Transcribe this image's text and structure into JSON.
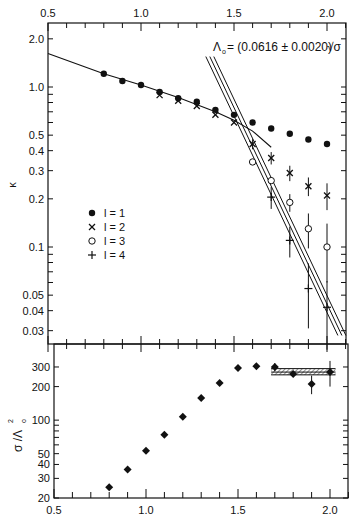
{
  "chart_data": [
    {
      "panel": "upper",
      "type": "scatter",
      "title": "",
      "annotation": "Λ₀ = (0.0616 ± 0.0020) √σ",
      "annotation_parts": {
        "lambda": "Λ",
        "sub": "o",
        "value": "= (0.0616 ± 0.0020)",
        "sqrt": "√σ"
      },
      "xlabel": "",
      "ylabel": "κ",
      "xscale": "linear",
      "yscale": "log",
      "xlim": [
        0.5,
        2.1
      ],
      "ylim": [
        0.025,
        2.3
      ],
      "x_tick_labels": [
        "0.5",
        "1.0",
        "1.5",
        "2.0"
      ],
      "y_tick_labels": [
        "2.0",
        "1.0",
        "0.5",
        "0.4",
        "0.3",
        "0.2",
        "0.1",
        "0.05",
        "0.04",
        "0.03"
      ],
      "y_ticks": [
        2.0,
        1.0,
        0.5,
        0.4,
        0.3,
        0.2,
        0.1,
        0.05,
        0.04,
        0.03
      ],
      "legend": {
        "position": "left-middle",
        "entries": [
          {
            "marker": "•",
            "label": "l = 1"
          },
          {
            "marker": "×",
            "label": "l = 2"
          },
          {
            "marker": "○",
            "label": "l = 3"
          },
          {
            "marker": "+",
            "label": "l = 4"
          }
        ]
      },
      "series": [
        {
          "name": "l = 1",
          "marker": "filled-circle",
          "x": [
            0.8,
            0.9,
            1.0,
            1.1,
            1.2,
            1.3,
            1.4,
            1.5,
            1.6,
            1.7,
            1.8,
            1.9,
            2.0
          ],
          "y": [
            1.21,
            1.09,
            1.03,
            0.93,
            0.85,
            0.81,
            0.72,
            0.67,
            0.6,
            0.55,
            0.51,
            0.47,
            0.44
          ]
        },
        {
          "name": "l = 2",
          "marker": "cross",
          "x": [
            1.1,
            1.2,
            1.3,
            1.4,
            1.5,
            1.6,
            1.7,
            1.8,
            1.9,
            2.0
          ],
          "y": [
            0.89,
            0.82,
            0.76,
            0.67,
            0.6,
            0.44,
            0.36,
            0.29,
            0.24,
            0.21
          ],
          "err": [
            0,
            0,
            0,
            0,
            0,
            0.02,
            0.02,
            0.02,
            0.02,
            0.025
          ]
        },
        {
          "name": "l = 3",
          "marker": "open-circle",
          "x": [
            1.6,
            1.7,
            1.8,
            1.9,
            2.0
          ],
          "y": [
            0.34,
            0.26,
            0.19,
            0.13,
            0.1
          ],
          "err": [
            0,
            0,
            0.015,
            0.02,
            0.025
          ]
        },
        {
          "name": "l = 4",
          "marker": "plus",
          "x": [
            1.7,
            1.8,
            1.9,
            2.0
          ],
          "y": [
            0.205,
            0.11,
            0.055,
            0.042
          ],
          "err": [
            0.02,
            0.015,
            0.015,
            0.012
          ]
        }
      ],
      "fit_curve": {
        "description": "strong-coupling curve",
        "x": [
          0.5,
          0.8,
          1.0,
          1.2,
          1.4,
          1.5,
          1.6,
          1.7
        ],
        "y": [
          1.62,
          1.21,
          1.03,
          0.86,
          0.7,
          0.62,
          0.53,
          0.42
        ]
      },
      "scaling_lines": {
        "description": "three parallel lines (central ± error)",
        "from": {
          "x": 1.37,
          "y": 1.55
        },
        "to": {
          "x": 2.08,
          "y": 0.028
        },
        "offsets_px": [
          -4,
          0,
          4
        ]
      }
    },
    {
      "panel": "lower",
      "type": "scatter",
      "title": "",
      "xlabel": "",
      "ylabel": "σ / Λ₀²",
      "ylabel_parts": {
        "main": "σ /Λ",
        "sub": "o",
        "sup": "2"
      },
      "xscale": "linear",
      "yscale": "log",
      "xlim": [
        0.5,
        2.1
      ],
      "ylim": [
        20,
        360
      ],
      "x_tick_labels": [
        "0.5",
        "1.0",
        "1.5",
        "2.0"
      ],
      "y_tick_labels": [
        "300",
        "200",
        "100",
        "50",
        "40",
        "30",
        "20"
      ],
      "y_ticks": [
        300,
        200,
        100,
        50,
        40,
        30,
        20
      ],
      "series": [
        {
          "name": "σ/Λ₀²",
          "marker": "filled-diamond",
          "x": [
            0.8,
            0.9,
            1.0,
            1.1,
            1.2,
            1.3,
            1.4,
            1.5,
            1.6,
            1.7,
            1.8,
            1.9,
            2.0
          ],
          "y": [
            25,
            36,
            53,
            74,
            107,
            158,
            215,
            294,
            305,
            300,
            260,
            211,
            270
          ],
          "err": [
            0,
            0,
            0,
            0,
            0,
            0,
            0,
            0,
            0,
            25,
            15,
            40,
            70
          ]
        }
      ],
      "band": {
        "description": "hatched band",
        "x": [
          1.68,
          2.03
        ],
        "y_center": 270,
        "y_range": [
          255,
          290
        ]
      }
    }
  ]
}
